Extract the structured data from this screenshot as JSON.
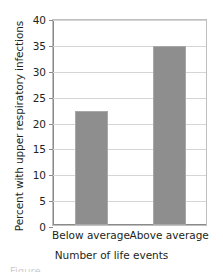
{
  "chart_data": {
    "type": "bar",
    "title": "",
    "categories": [
      "Below average",
      "Above average"
    ],
    "values": [
      22.0,
      34.5
    ],
    "xlabel": "Number of life events",
    "ylabel": "Percent with upper respiratory infections",
    "ylim": [
      0,
      40
    ],
    "ytick_step": 5,
    "yticks": [
      "0",
      "5",
      "10",
      "15",
      "20",
      "25",
      "30",
      "35",
      "40"
    ],
    "grid": "horizontal",
    "legend": "none",
    "bar_color": "#8e8e8e",
    "grid_color": "#d5d5d5",
    "axis_color": "#8a8a8a",
    "text_color": "#231f20"
  },
  "figure": {
    "caption_remnant": "Figure"
  }
}
